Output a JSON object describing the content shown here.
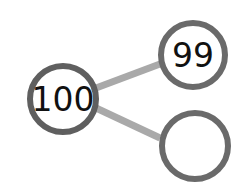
{
  "diagram": {
    "type": "number-bond",
    "whole": {
      "label": "100"
    },
    "parts": [
      {
        "label": "99"
      },
      {
        "label": ""
      }
    ],
    "colors": {
      "circle_stroke": "#5f5f5f",
      "connector": "#a9a9a9",
      "fill": "#ffffff",
      "text": "#111111"
    }
  }
}
